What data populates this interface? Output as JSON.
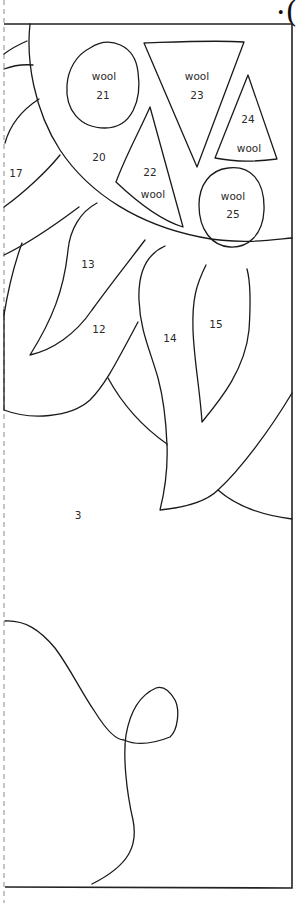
{
  "page": {
    "type": "applique pattern template",
    "corner_glyph": "·("
  },
  "pieces": [
    {
      "id": "21",
      "number": "21",
      "material": "wool",
      "shape": "oval"
    },
    {
      "id": "23",
      "number": "23",
      "material": "wool",
      "shape": "inverted-triangle"
    },
    {
      "id": "24",
      "number": "24",
      "material": "wool",
      "shape": "triangle"
    },
    {
      "id": "22",
      "number": "22",
      "material": "wool",
      "shape": "triangle"
    },
    {
      "id": "25",
      "number": "25",
      "material": "wool",
      "shape": "oval"
    },
    {
      "id": "20",
      "number": "20",
      "material": "",
      "shape": "flower-center"
    },
    {
      "id": "17",
      "number": "17",
      "material": "",
      "shape": "petal"
    },
    {
      "id": "13",
      "number": "13",
      "material": "",
      "shape": "petal"
    },
    {
      "id": "12",
      "number": "12",
      "material": "",
      "shape": "petal"
    },
    {
      "id": "14",
      "number": "14",
      "material": "",
      "shape": "petal"
    },
    {
      "id": "15",
      "number": "15",
      "material": "",
      "shape": "petal"
    },
    {
      "id": "3",
      "number": "3",
      "material": "",
      "shape": "background"
    }
  ],
  "labels": {
    "wool": "wool",
    "n21": "21",
    "n23": "23",
    "n24": "24",
    "n22": "22",
    "n25": "25",
    "n20": "20",
    "n17": "17",
    "n13": "13",
    "n12": "12",
    "n14": "14",
    "n15": "15",
    "n3": "3"
  },
  "colors": {
    "line": "#1a1a1a",
    "background": "#ffffff",
    "cut_line": "#8a8a8a"
  }
}
